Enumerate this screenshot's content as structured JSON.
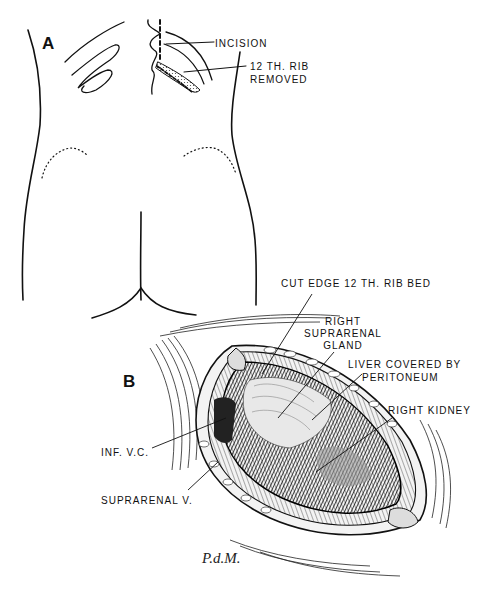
{
  "figure": {
    "panel_a": {
      "letter": "A",
      "labels": {
        "incision": "INCISION",
        "rib_line1": "12 TH. RIB",
        "rib_line2": "REMOVED"
      }
    },
    "panel_b": {
      "letter": "B",
      "labels": {
        "cut_edge": "CUT EDGE 12 TH. RIB BED",
        "suprarenal_gland_1": "RIGHT",
        "suprarenal_gland_2": "SUPRARENAL",
        "suprarenal_gland_3": "GLAND",
        "liver_1": "LIVER COVERED BY",
        "liver_2": "PERITONEUM",
        "kidney": "RIGHT KIDNEY",
        "ivc": "INF. V.C.",
        "suprarenal_v": "SUPRARENAL V."
      }
    },
    "signature": "P.d.M."
  }
}
